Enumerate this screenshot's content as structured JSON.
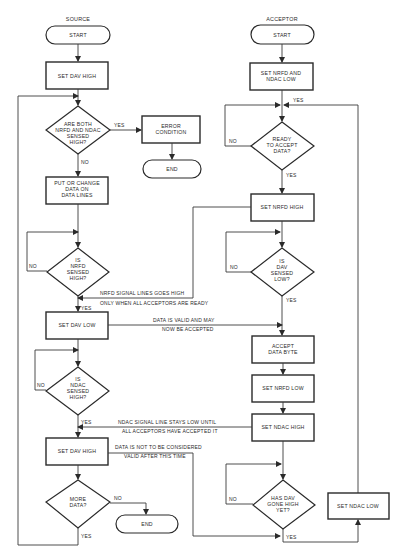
{
  "source": {
    "header": "SOURCE",
    "start": "START",
    "set_dav_high_1": "SET DAV HIGH",
    "are_both": [
      "ARE BOTH",
      "NRFD AND NDAC",
      "SENSED",
      "HIGH?"
    ],
    "error_condition": [
      "ERROR",
      "CONDITION"
    ],
    "end_error": "END",
    "put_change": [
      "PUT OR CHANGE",
      "DATA ON",
      "DATA LINES"
    ],
    "is_nrfd": [
      "IS",
      "NRFD",
      "SENSED",
      "HIGH?"
    ],
    "set_dav_low": "SET DAV LOW",
    "is_ndac": [
      "IS",
      "NDAC",
      "SENSED",
      "HIGH?"
    ],
    "set_dav_high_2": "SET DAV HIGH",
    "more_data": [
      "MORE",
      "DATA?"
    ],
    "end_final": "END"
  },
  "acceptor": {
    "header": "ACCEPTOR",
    "start": "START",
    "set_nrfd_ndac_low": [
      "SET NRFD AND",
      "NDAC LOW"
    ],
    "ready": [
      "READY",
      "TO ACCEPT",
      "DATA?"
    ],
    "set_nrfd_high": "SET NRFD HIGH",
    "is_dav": [
      "IS",
      "DAV",
      "SENSED",
      "LOW?"
    ],
    "accept_data": [
      "ACCEPT",
      "DATA BYTE"
    ],
    "set_nrfd_low": "SET NRFD LOW",
    "set_ndac_high": "SET NDAC HIGH",
    "has_dav": [
      "HAS DAV",
      "GONE HIGH",
      "YET?"
    ],
    "set_ndac_low": "SET NDAC LOW"
  },
  "labels": {
    "yes": "YES",
    "no": "NO"
  },
  "annotations": {
    "nrfd_signal": [
      "NRFD SIGNAL LINES GOES HIGH",
      "ONLY WHEN ALL ACCEPTORS ARE READY"
    ],
    "data_valid": [
      "DATA IS VALID AND MAY",
      "NOW BE ACCEPTED"
    ],
    "ndac_signal": [
      "NDAC SIGNAL LINE STAYS LOW UNTIL",
      "ALL ACCEPTORS HAVE ACCEPTED IT"
    ],
    "data_not_valid": [
      "DATA IS NOT TO BE CONSIDERED",
      "VALID AFTER THIS TIME"
    ]
  }
}
